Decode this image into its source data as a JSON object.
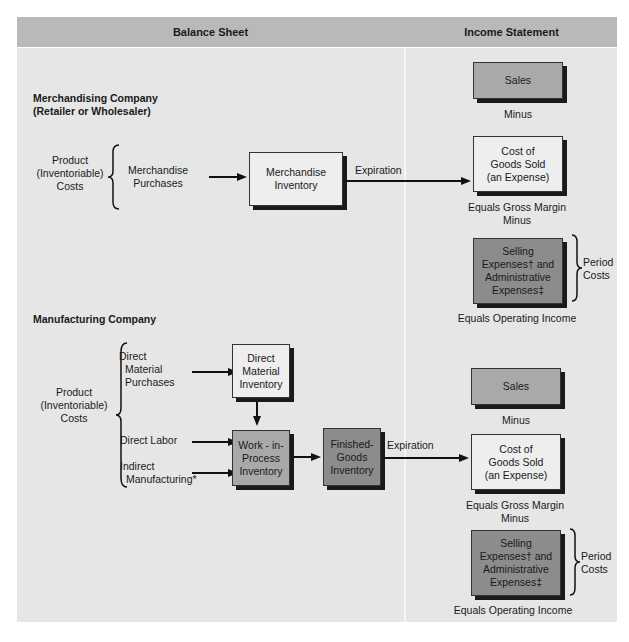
{
  "header": {
    "balance_sheet": "Balance Sheet",
    "income_statement": "Income Statement"
  },
  "merchandising": {
    "title_line1": "Merchandising Company",
    "title_line2": "(Retailer or Wholesaler)",
    "product_costs": [
      "Product",
      "(Inventoriable)",
      "Costs"
    ],
    "purchases": [
      "Merchandise",
      "Purchases"
    ],
    "inventory": [
      "Merchandise",
      "Inventory"
    ],
    "expiration": "Expiration",
    "income": {
      "sales": "Sales",
      "minus1": "Minus",
      "cogs": [
        "Cost of",
        "Goods Sold",
        "(an Expense)"
      ],
      "gross_margin": "Equals Gross Margin",
      "minus2": "Minus",
      "expenses": [
        "Selling",
        "Expenses† and",
        "Administrative",
        "Expenses‡"
      ],
      "period_costs": [
        "Period",
        "Costs"
      ],
      "operating_income": "Equals Operating Income"
    }
  },
  "manufacturing": {
    "title": "Manufacturing Company",
    "product_costs": [
      "Product",
      "(Inventoriable)",
      "Costs"
    ],
    "direct_material_purchases": [
      "Direct",
      "Material",
      "Purchases"
    ],
    "direct_labor": "Direct Labor",
    "indirect_manufacturing": [
      "Indirect",
      "Manufacturing*"
    ],
    "direct_material_inventory": [
      "Direct",
      "Material",
      "Inventory"
    ],
    "wip_inventory": [
      "Work - in-",
      "Process",
      "Inventory"
    ],
    "finished_goods_inventory": [
      "Finished-",
      "Goods",
      "Inventory"
    ],
    "expiration": "Expiration",
    "income": {
      "sales": "Sales",
      "minus1": "Minus",
      "cogs": [
        "Cost of",
        "Goods Sold",
        "(an Expense)"
      ],
      "gross_margin": "Equals Gross Margin",
      "minus2": "Minus",
      "expenses": [
        "Selling",
        "Expenses† and",
        "Administrative",
        "Expenses‡"
      ],
      "period_costs": [
        "Period",
        "Costs"
      ],
      "operating_income": "Equals Operating Income"
    }
  },
  "colors": {
    "header_bg": "#b9b9b9",
    "panel_bg": "#e6e6e6",
    "light_box": "#eeeeee",
    "mid_box": "#a9a9a9",
    "dark_box": "#8c8c8c"
  }
}
